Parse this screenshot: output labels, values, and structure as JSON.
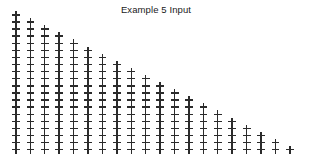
{
  "figure": {
    "title": "Example 5 Input",
    "background_color": "#ffffff",
    "width": 312,
    "height": 158
  },
  "chart_data": {
    "type": "scatter",
    "title": "Example 5 Input",
    "xlabel": "",
    "ylabel": "",
    "marker": "+",
    "marker_color": "#2b2b2b",
    "grid": false,
    "legend": null,
    "axes_visible": false,
    "tick_labels_visible": false,
    "xlim": [
      0,
      21
    ],
    "ylim": [
      21,
      0
    ],
    "n_columns": 20,
    "n_rows": 20,
    "column_start_rows": [
      1,
      2,
      3,
      4,
      5,
      6,
      7,
      8,
      9,
      10,
      11,
      12,
      13,
      14,
      15,
      16,
      17,
      18,
      19,
      20
    ],
    "column_counts": [
      20,
      19,
      18,
      17,
      16,
      15,
      14,
      13,
      12,
      11,
      10,
      9,
      8,
      7,
      6,
      5,
      4,
      3,
      2,
      1
    ],
    "total_points": 210,
    "points_x": [
      1,
      1,
      1,
      1,
      1,
      1,
      1,
      1,
      1,
      1,
      1,
      1,
      1,
      1,
      1,
      1,
      1,
      1,
      1,
      1,
      2,
      2,
      2,
      2,
      2,
      2,
      2,
      2,
      2,
      2,
      2,
      2,
      2,
      2,
      2,
      2,
      2,
      2,
      2,
      3,
      3,
      3,
      3,
      3,
      3,
      3,
      3,
      3,
      3,
      3,
      3,
      3,
      3,
      3,
      3,
      3,
      3,
      4,
      4,
      4,
      4,
      4,
      4,
      4,
      4,
      4,
      4,
      4,
      4,
      4,
      4,
      4,
      4,
      4,
      5,
      5,
      5,
      5,
      5,
      5,
      5,
      5,
      5,
      5,
      5,
      5,
      5,
      5,
      5,
      5,
      6,
      6,
      6,
      6,
      6,
      6,
      6,
      6,
      6,
      6,
      6,
      6,
      6,
      6,
      6,
      7,
      7,
      7,
      7,
      7,
      7,
      7,
      7,
      7,
      7,
      7,
      7,
      7,
      7,
      8,
      8,
      8,
      8,
      8,
      8,
      8,
      8,
      8,
      8,
      8,
      8,
      8,
      9,
      9,
      9,
      9,
      9,
      9,
      9,
      9,
      9,
      9,
      9,
      9,
      10,
      10,
      10,
      10,
      10,
      10,
      10,
      10,
      10,
      10,
      10,
      11,
      11,
      11,
      11,
      11,
      11,
      11,
      11,
      11,
      11,
      12,
      12,
      12,
      12,
      12,
      12,
      12,
      12,
      12,
      13,
      13,
      13,
      13,
      13,
      13,
      13,
      13,
      14,
      14,
      14,
      14,
      14,
      14,
      14,
      15,
      15,
      15,
      15,
      15,
      15,
      16,
      16,
      16,
      16,
      16,
      17,
      17,
      17,
      17,
      18,
      18,
      18,
      19,
      19,
      20
    ],
    "points_y": [
      1,
      2,
      3,
      4,
      5,
      6,
      7,
      8,
      9,
      10,
      11,
      12,
      13,
      14,
      15,
      16,
      17,
      18,
      19,
      20,
      2,
      3,
      4,
      5,
      6,
      7,
      8,
      9,
      10,
      11,
      12,
      13,
      14,
      15,
      16,
      17,
      18,
      19,
      20,
      3,
      4,
      5,
      6,
      7,
      8,
      9,
      10,
      11,
      12,
      13,
      14,
      15,
      16,
      17,
      18,
      19,
      20,
      4,
      5,
      6,
      7,
      8,
      9,
      10,
      11,
      12,
      13,
      14,
      15,
      16,
      17,
      18,
      19,
      20,
      5,
      6,
      7,
      8,
      9,
      10,
      11,
      12,
      13,
      14,
      15,
      16,
      17,
      18,
      19,
      20,
      6,
      7,
      8,
      9,
      10,
      11,
      12,
      13,
      14,
      15,
      16,
      17,
      18,
      19,
      20,
      7,
      8,
      9,
      10,
      11,
      12,
      13,
      14,
      15,
      16,
      17,
      18,
      19,
      20,
      8,
      9,
      10,
      11,
      12,
      13,
      14,
      15,
      16,
      17,
      18,
      19,
      20,
      9,
      10,
      11,
      12,
      13,
      14,
      15,
      16,
      17,
      18,
      19,
      20,
      10,
      11,
      12,
      13,
      14,
      15,
      16,
      17,
      18,
      19,
      20,
      11,
      12,
      13,
      14,
      15,
      16,
      17,
      18,
      19,
      20,
      12,
      13,
      14,
      15,
      16,
      17,
      18,
      19,
      20,
      13,
      14,
      15,
      16,
      17,
      18,
      19,
      20,
      14,
      15,
      16,
      17,
      18,
      19,
      20,
      15,
      16,
      17,
      18,
      19,
      20,
      16,
      17,
      18,
      19,
      20,
      17,
      18,
      19,
      20,
      18,
      19,
      20,
      19,
      20,
      20
    ]
  },
  "layout": {
    "origin_x": 16,
    "origin_y": 15,
    "step_x": 14.42,
    "step_y": 7.1
  }
}
